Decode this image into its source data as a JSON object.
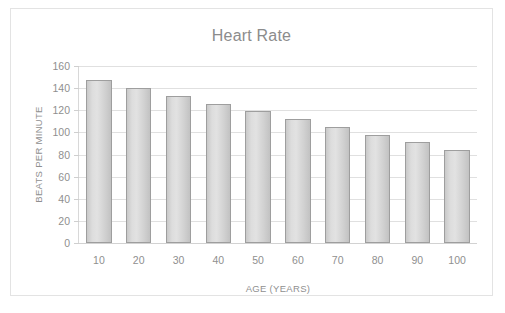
{
  "chart_data": {
    "type": "bar",
    "title": "Heart Rate",
    "xlabel": "AGE (YEARS)",
    "ylabel": "BEATS PER MINUTE",
    "categories": [
      "10",
      "20",
      "30",
      "40",
      "50",
      "60",
      "70",
      "80",
      "90",
      "100"
    ],
    "values": [
      147,
      140,
      133,
      126,
      119,
      112,
      105,
      98,
      91,
      84
    ],
    "ylim": [
      0,
      160
    ],
    "ytick_labels": [
      "0",
      "20",
      "40",
      "60",
      "80",
      "100",
      "120",
      "140",
      "160"
    ],
    "ytick_values": [
      0,
      20,
      40,
      60,
      80,
      100,
      120,
      140,
      160
    ],
    "grid": true,
    "legend": false,
    "colors": {
      "bar_fill_light": "#e2e2e2",
      "bar_fill_dark": "#c2c2c2",
      "bar_border": "#9e9e9e",
      "gridline": "#e0e0e0",
      "text": "#8f8f8f",
      "title_text": "#8c8c8c",
      "frame_border": "#e3e3e3",
      "background": "#ffffff"
    }
  }
}
